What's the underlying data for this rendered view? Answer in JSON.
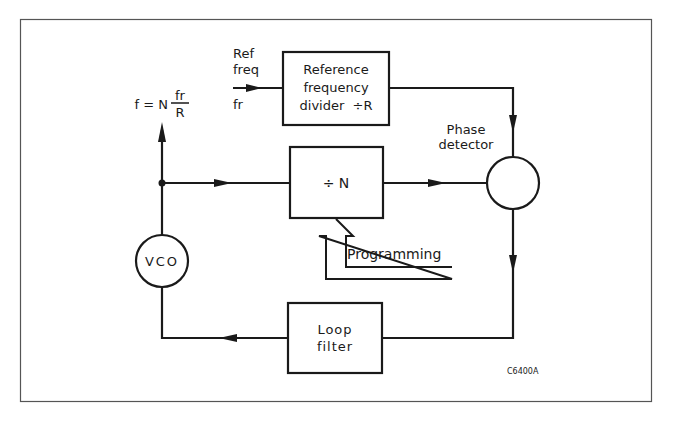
{
  "diagram": {
    "figure_code": "C6400A",
    "output_formula": {
      "lhs": "f = N",
      "numerator": "fr",
      "denominator": "R"
    },
    "input": {
      "label_line1": "Ref",
      "label_line2": "freq",
      "symbol": "fr"
    },
    "blocks": {
      "ref_divider": {
        "line1": "Reference",
        "line2": "frequency",
        "line3": "divider  ÷R"
      },
      "n_divider": {
        "label": "÷ N"
      },
      "loop_filter": {
        "line1": "Loop",
        "line2": "filter"
      },
      "vco": {
        "label": "VCO"
      },
      "phase_detector": {
        "line1": "Phase",
        "line2": "detector"
      }
    },
    "programming_label": "Programming",
    "connections": [
      {
        "from": "Ref freq (fr)",
        "to": "Reference frequency divider ÷R"
      },
      {
        "from": "Reference frequency divider ÷R",
        "to": "Phase detector"
      },
      {
        "from": "VCO output node",
        "to": "÷N"
      },
      {
        "from": "÷N",
        "to": "Phase detector"
      },
      {
        "from": "Phase detector",
        "to": "Loop filter"
      },
      {
        "from": "Loop filter",
        "to": "VCO"
      },
      {
        "from": "VCO output node",
        "to": "Output f = N·fr/R"
      },
      {
        "from": "Programming",
        "to": "÷N"
      }
    ]
  }
}
